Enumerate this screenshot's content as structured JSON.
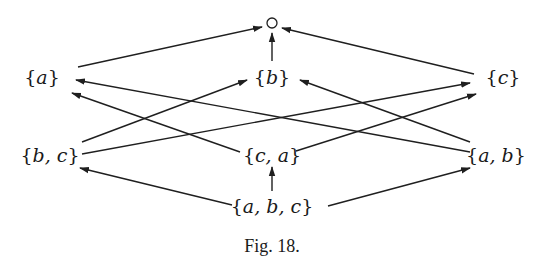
{
  "figure": {
    "caption": "Fig. 18.",
    "colors": {
      "line": "#1f1f1f",
      "text": "#1a1a1a",
      "background": "#ffffff"
    }
  },
  "nodes": [
    {
      "id": "empty",
      "label": "",
      "symbol": "circle",
      "x": 272,
      "y": 23
    },
    {
      "id": "a",
      "label": "a",
      "x": 42,
      "y": 77
    },
    {
      "id": "b",
      "label": "b",
      "x": 272,
      "y": 77
    },
    {
      "id": "c",
      "label": "c",
      "x": 503,
      "y": 77
    },
    {
      "id": "bc",
      "label": "b, c",
      "x": 50,
      "y": 155
    },
    {
      "id": "ca",
      "label": "c, a",
      "x": 272,
      "y": 155
    },
    {
      "id": "ab",
      "label": "a, b",
      "x": 496,
      "y": 155
    },
    {
      "id": "abc",
      "label": "a, b, c",
      "x": 272,
      "y": 206
    }
  ],
  "edges": [
    {
      "from": "a",
      "to": "empty",
      "x1": 78,
      "y1": 67,
      "x2": 262,
      "y2": 27
    },
    {
      "from": "b",
      "to": "empty",
      "x1": 272,
      "y1": 61,
      "x2": 272,
      "y2": 33
    },
    {
      "from": "c",
      "to": "empty",
      "x1": 474,
      "y1": 74,
      "x2": 282,
      "y2": 28
    },
    {
      "from": "bc",
      "to": "b",
      "x1": 82,
      "y1": 142,
      "x2": 247,
      "y2": 80
    },
    {
      "from": "bc",
      "to": "c",
      "x1": 82,
      "y1": 154,
      "x2": 470,
      "y2": 83
    },
    {
      "from": "ca",
      "to": "a",
      "x1": 240,
      "y1": 152,
      "x2": 72,
      "y2": 93
    },
    {
      "from": "ca",
      "to": "c",
      "x1": 296,
      "y1": 151,
      "x2": 476,
      "y2": 94
    },
    {
      "from": "ab",
      "to": "a",
      "x1": 470,
      "y1": 152,
      "x2": 76,
      "y2": 80
    },
    {
      "from": "ab",
      "to": "b",
      "x1": 470,
      "y1": 142,
      "x2": 300,
      "y2": 80
    },
    {
      "from": "abc",
      "to": "bc",
      "x1": 232,
      "y1": 205,
      "x2": 80,
      "y2": 168
    },
    {
      "from": "abc",
      "to": "ca",
      "x1": 272,
      "y1": 191,
      "x2": 272,
      "y2": 167
    },
    {
      "from": "abc",
      "to": "ab",
      "x1": 328,
      "y1": 206,
      "x2": 470,
      "y2": 168
    }
  ]
}
